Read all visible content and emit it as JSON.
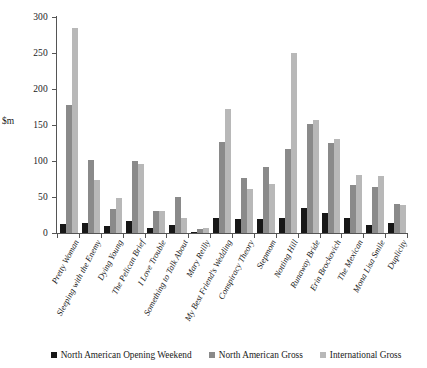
{
  "chart_data": {
    "type": "bar",
    "title": "",
    "xlabel": "",
    "ylabel": "$m",
    "ylim": [
      0,
      300
    ],
    "yticks": [
      0,
      50,
      100,
      150,
      200,
      250,
      300
    ],
    "grid": false,
    "legend_position": "bottom",
    "categories": [
      "Pretty Woman",
      "Sleeping with the Enemy",
      "Dying Young",
      "The Pelican Brief",
      "I Love Trouble",
      "Something to Talk About",
      "Mary Reilly",
      "My Best Friend's Wedding",
      "Conspiracy Theory",
      "Stepmom",
      "Notting Hill",
      "Runaway Bride",
      "Erin Brockovich",
      "The Mexican",
      "Mona Lisa Smile",
      "Duplicity"
    ],
    "series": [
      {
        "name": "North American Opening Weekend",
        "color": "#171717",
        "values": [
          12,
          13.5,
          9.5,
          16,
          7.5,
          10.5,
          2,
          21.5,
          19,
          19,
          21.5,
          35,
          28,
          20.5,
          11.5,
          14
        ]
      },
      {
        "name": "North American Gross",
        "color": "#8a8a8a",
        "values": [
          178,
          101,
          33,
          100,
          30.5,
          50.5,
          5.5,
          127,
          76,
          91,
          116,
          152,
          125.5,
          66.5,
          63.5,
          40.5
        ]
      },
      {
        "name": "International Gross",
        "color": "#b8b8b8",
        "values": [
          285,
          73,
          48,
          95.5,
          30.5,
          21.5,
          7.5,
          172,
          61,
          68,
          250,
          157,
          131,
          80,
          78.5,
          38.5
        ]
      }
    ]
  },
  "legend": {
    "items": [
      {
        "label": "North American Opening Weekend",
        "color": "#171717"
      },
      {
        "label": "North American Gross",
        "color": "#8a8a8a"
      },
      {
        "label": "International Gross",
        "color": "#b8b8b8"
      }
    ]
  }
}
